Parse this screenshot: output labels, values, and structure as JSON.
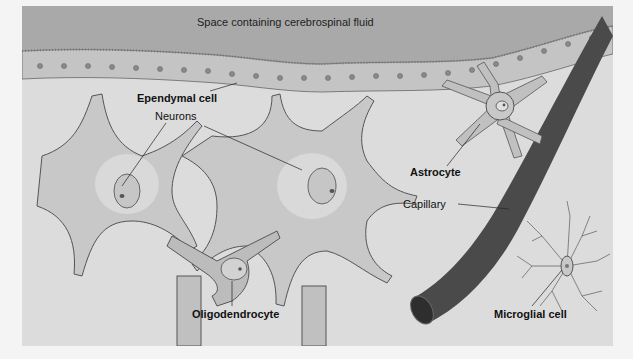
{
  "diagram": {
    "type": "labeled-biology-illustration",
    "colors": {
      "background": "#f4f4f4",
      "panel": "#dcdcdc",
      "csf_space": "#a9a9a9",
      "cell_fill": "#c8c8c8",
      "cell_outline": "#555555",
      "capillary": "#4a4a4a",
      "label_text": "#111111"
    },
    "labels": {
      "csf_space": "Space containing cerebrospinal fluid",
      "ependymal": "Ependymal cell",
      "neurons": "Neurons",
      "astrocyte": "Astrocyte",
      "capillary": "Capillary",
      "oligodendrocyte": "Oligodendrocyte",
      "microglial": "Microglial cell"
    }
  }
}
